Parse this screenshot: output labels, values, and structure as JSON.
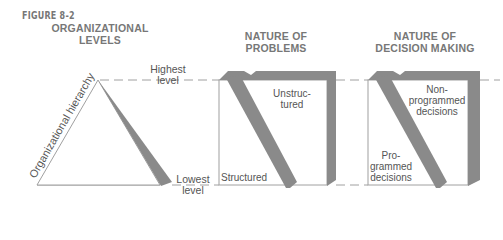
{
  "figure_label": "FIGURE 8-2",
  "headings": {
    "levels": [
      "ORGANIZATIONAL",
      "LEVELS"
    ],
    "problems": [
      "NATURE OF",
      "PROBLEMS"
    ],
    "decisions": [
      "NATURE OF",
      "DECISION MAKING"
    ]
  },
  "pyramid": {
    "axis_label": "Organizational hierarchy",
    "top_label": [
      "Highest",
      "level"
    ],
    "bottom_label": [
      "Lowest",
      "level"
    ]
  },
  "problems_box": {
    "top_label": [
      "Unstruc-",
      "tured"
    ],
    "bottom_label": "Structured"
  },
  "decisions_box": {
    "top_label": [
      "Non-",
      "programmed",
      "decisions"
    ],
    "bottom_label": [
      "Pro-",
      "grammed",
      "decisions"
    ]
  },
  "colors": {
    "shade": "#8a8a8a",
    "line": "#9a9a9a",
    "text": "#555555",
    "heading": "#777777"
  }
}
